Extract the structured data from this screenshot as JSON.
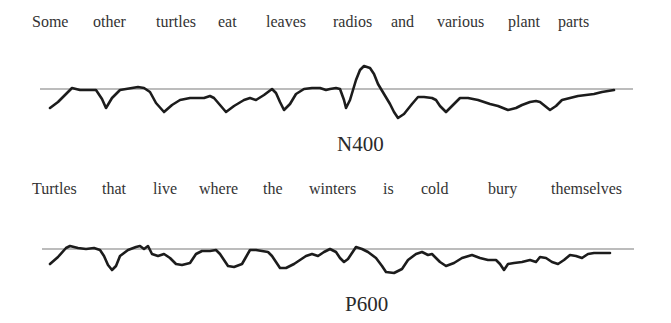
{
  "panels": [
    {
      "sentence_words": [
        {
          "text": "Some",
          "x": 32
        },
        {
          "text": "other",
          "x": 93
        },
        {
          "text": "turtles",
          "x": 156
        },
        {
          "text": "eat",
          "x": 218
        },
        {
          "text": "leaves",
          "x": 266
        },
        {
          "text": "radios",
          "x": 333
        },
        {
          "text": "and",
          "x": 391
        },
        {
          "text": "various",
          "x": 437
        },
        {
          "text": "plant",
          "x": 508
        },
        {
          "text": "parts",
          "x": 558
        }
      ],
      "component_label": "N400",
      "baseline": {
        "x1": 40,
        "x2": 633,
        "y": 89
      },
      "waveform_points": "50,108 58,102 66,94 72,88 80,90 88,90 96,90 102,99 106,108 112,98 120,90 126,89 132,88 138,87 144,88 150,92 156,103 164,112 172,105 180,100 190,98 204,98 210,96 214,98 220,105 226,112 234,106 244,100 250,98 256,100 264,95 272,89 276,93 280,102 284,110 290,104 296,94 304,89 312,88 320,88 326,90 330,89 336,88 340,89 344,100 346,108 350,100 356,80 360,70 364,66 370,68 374,74 378,84 384,94 390,104 394,112 398,118 404,114 412,104 418,97 424,97 432,98 436,100 440,106 446,112 452,106 460,98 468,98 478,100 484,102 490,104 498,106 508,110 516,108 522,105 530,102 536,101 540,102 545,106 550,110 556,106 562,100 570,98 578,96 586,95 594,94 602,92 614,90"
    },
    {
      "sentence_words": [
        {
          "text": "Turtles",
          "x": 32
        },
        {
          "text": "that",
          "x": 102
        },
        {
          "text": "live",
          "x": 153
        },
        {
          "text": "where",
          "x": 199
        },
        {
          "text": "the",
          "x": 263
        },
        {
          "text": "winters",
          "x": 309
        },
        {
          "text": "is",
          "x": 383
        },
        {
          "text": "cold",
          "x": 421
        },
        {
          "text": "bury",
          "x": 488
        },
        {
          "text": "themselves",
          "x": 551
        }
      ],
      "component_label": "P600",
      "baseline": {
        "x1": 42,
        "x2": 634,
        "y": 249
      },
      "waveform_points": "50,264 58,257 66,248 70,246 78,248 86,249 94,248 100,250 104,256 108,265 112,270 116,266 120,256 128,250 136,247 140,246 144,249 148,246 152,254 158,256 164,254 170,258 176,264 182,265 190,263 196,254 202,251 210,251 216,250 220,254 224,260 228,266 234,267 242,264 246,257 250,250 256,250 262,251 268,252 272,256 276,262 280,268 286,268 294,264 300,260 306,256 312,254 318,256 324,252 330,249 336,252 340,258 344,262 348,259 352,253 356,247 362,249 368,252 376,258 382,266 386,272 394,273 402,269 408,260 416,254 422,252 428,255 432,254 440,262 446,266 454,263 462,258 472,255 480,258 488,260 496,260 500,264 504,270 508,264 514,263 522,262 530,260 536,262 540,257 546,258 552,262 558,264 564,260 570,255 576,256 582,258 588,254 594,253 602,253 610,253"
    }
  ],
  "colors": {
    "text": "#333333",
    "waveform": "#1c1c1c",
    "baseline": "#7a7a7a",
    "background": "#ffffff"
  }
}
